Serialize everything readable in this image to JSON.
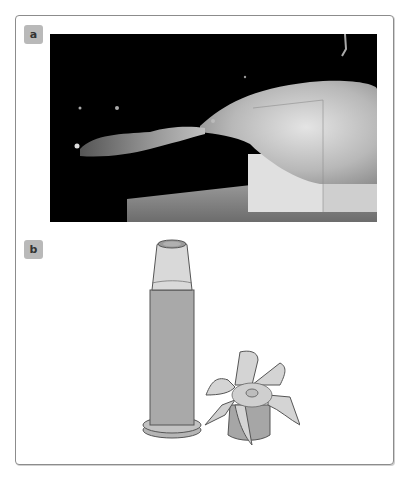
{
  "figure": {
    "panels": [
      {
        "label": "a",
        "content": "high-speed photograph of bullet exiting ballistic gelatin block with temporary cavity and debris plume"
      },
      {
        "label": "b",
        "content": "illustration of cartridge and expanded hollow-point bullet with petals"
      }
    ]
  },
  "colors": {
    "frame_border": "#8c8c8c",
    "label_bg": "#b9b9b9",
    "photo_bg": "#000000",
    "gelatin": "#c8c8c8",
    "casing": "#a9a9a9",
    "bullet_tip": "#d9d9d9"
  }
}
